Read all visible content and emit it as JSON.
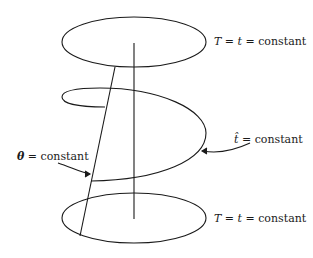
{
  "diagram": {
    "stroke_color": "#1a1a1a",
    "labels": {
      "top": {
        "var1": "T",
        "eq1": " = ",
        "var2": "t",
        "eq2": " = ",
        "text": "constant"
      },
      "middle": {
        "var": "t̂",
        "eq": " = ",
        "text": "constant"
      },
      "theta": {
        "var": "θ",
        "eq": " = ",
        "text": "constant"
      },
      "bottom": {
        "var1": "T",
        "eq1": " = ",
        "var2": "t",
        "eq2": " = ",
        "text": "constant"
      }
    },
    "elements": [
      {
        "name": "top-ellipse",
        "meaning": "T = t = constant surface"
      },
      {
        "name": "bottom-ellipse",
        "meaning": "T = t = constant surface"
      },
      {
        "name": "spiral-surface",
        "meaning": "t̂ = constant surface"
      },
      {
        "name": "vertical-axis",
        "meaning": "central axis"
      },
      {
        "name": "slanted-line",
        "meaning": "θ = constant line"
      }
    ]
  }
}
